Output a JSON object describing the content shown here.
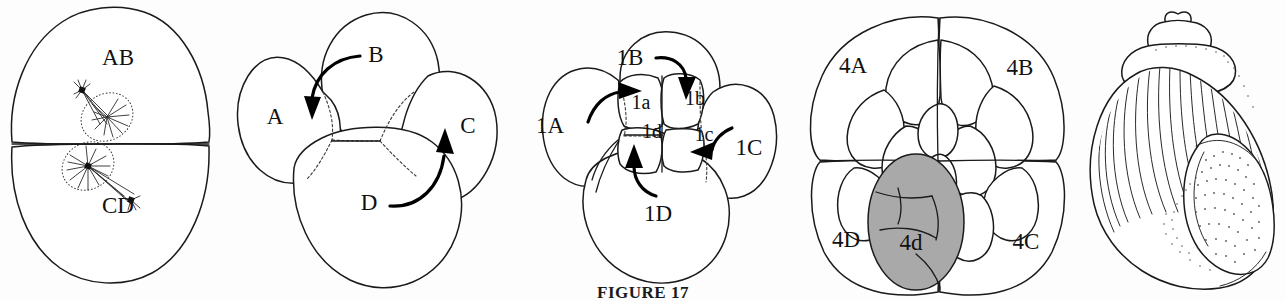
{
  "figure": {
    "caption_label": "FIGURE",
    "caption_number": "17",
    "caption_full": "FIGURE 17"
  },
  "colors": {
    "ink": "#1a1a1a",
    "background": "#fdfdfd",
    "shaded_cell": "#a9a9a9",
    "arrow": "#000000",
    "hidden_outline": "#3a3a3a"
  },
  "panels": [
    {
      "id": "panel-1",
      "name": "two-cell-stage",
      "labels": [
        {
          "text": "AB",
          "x": 118,
          "y": 60
        },
        {
          "text": "CD",
          "x": 118,
          "y": 208
        }
      ]
    },
    {
      "id": "panel-2",
      "name": "four-cell-stage",
      "labels": [
        {
          "text": "A",
          "x": 47,
          "y": 119
        },
        {
          "text": "B",
          "x": 148,
          "y": 57
        },
        {
          "text": "C",
          "x": 240,
          "y": 128
        },
        {
          "text": "D",
          "x": 141,
          "y": 205
        }
      ]
    },
    {
      "id": "panel-3",
      "name": "eight-cell-first-quartet",
      "labels": [
        {
          "text": "1A",
          "x": 42,
          "y": 128
        },
        {
          "text": "1B",
          "x": 122,
          "y": 60
        },
        {
          "text": "1C",
          "x": 241,
          "y": 150
        },
        {
          "text": "1D",
          "x": 150,
          "y": 216
        },
        {
          "text": "1a",
          "x": 133,
          "y": 103
        },
        {
          "text": "1b",
          "x": 187,
          "y": 99
        },
        {
          "text": "1c",
          "x": 196,
          "y": 136
        },
        {
          "text": "1d",
          "x": 144,
          "y": 133
        }
      ]
    },
    {
      "id": "panel-4",
      "name": "late-cleavage-mesentoblast",
      "labels": [
        {
          "text": "4A",
          "x": 55,
          "y": 68
        },
        {
          "text": "4B",
          "x": 222,
          "y": 70
        },
        {
          "text": "4C",
          "x": 228,
          "y": 244
        },
        {
          "text": "4D",
          "x": 48,
          "y": 242
        },
        {
          "text": "4d",
          "x": 113,
          "y": 245
        }
      ]
    },
    {
      "id": "panel-5",
      "name": "adult-snail-shell",
      "labels": []
    }
  ]
}
